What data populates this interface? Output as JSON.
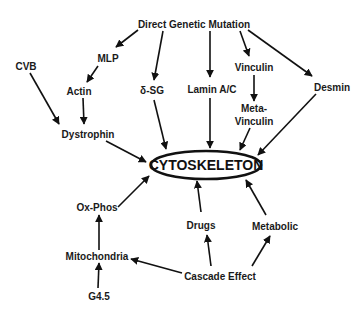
{
  "center": {
    "label": "CYTOSKELETON",
    "shape": "ellipse"
  },
  "nodes": {
    "direct_genetic_mutation": "Direct Genetic Mutation",
    "mlp": "MLP",
    "cvb": "CVB",
    "actin": "Actin",
    "delta_sg": "δ-SG",
    "lamin": "Lamin A/C",
    "vinculin": "Vinculin",
    "desmin": "Desmin",
    "meta_vinculin_1": "Meta-",
    "meta_vinculin_2": "Vinculin",
    "dystrophin": "Dystrophin",
    "ox_phos": "Ox-Phos",
    "drugs": "Drugs",
    "metabolic": "Metabolic",
    "mitochondria": "Mitochondria",
    "cascade_effect": "Cascade Effect",
    "g45": "G4.5"
  },
  "edges": [
    [
      "Direct Genetic Mutation",
      "MLP"
    ],
    [
      "Direct Genetic Mutation",
      "δ-SG"
    ],
    [
      "Direct Genetic Mutation",
      "Lamin A/C"
    ],
    [
      "Direct Genetic Mutation",
      "Vinculin"
    ],
    [
      "Direct Genetic Mutation",
      "Desmin"
    ],
    [
      "MLP",
      "Actin"
    ],
    [
      "Actin",
      "Dystrophin"
    ],
    [
      "CVB",
      "Dystrophin"
    ],
    [
      "Dystrophin",
      "CYTOSKELETON"
    ],
    [
      "δ-SG",
      "CYTOSKELETON"
    ],
    [
      "Lamin A/C",
      "CYTOSKELETON"
    ],
    [
      "Vinculin",
      "Meta-Vinculin"
    ],
    [
      "Meta-Vinculin",
      "CYTOSKELETON"
    ],
    [
      "Desmin",
      "CYTOSKELETON"
    ],
    [
      "Ox-Phos",
      "CYTOSKELETON"
    ],
    [
      "Mitochondria",
      "Ox-Phos"
    ],
    [
      "G4.5",
      "Mitochondria"
    ],
    [
      "Cascade Effect",
      "Mitochondria"
    ],
    [
      "Cascade Effect",
      "Drugs"
    ],
    [
      "Cascade Effect",
      "Metabolic"
    ],
    [
      "Drugs",
      "CYTOSKELETON"
    ],
    [
      "Metabolic",
      "CYTOSKELETON"
    ]
  ]
}
